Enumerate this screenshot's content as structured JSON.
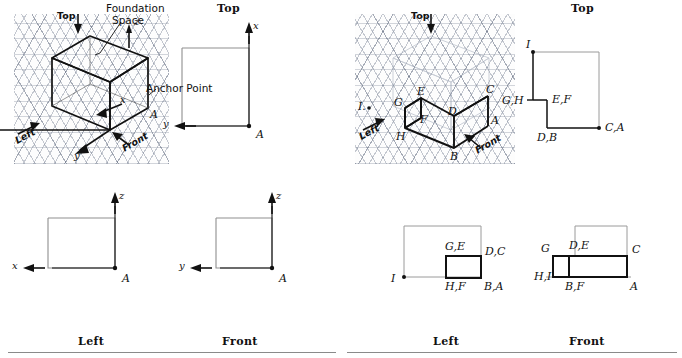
{
  "figure": {
    "title_left_panel": "Foundation space with anchor point",
    "title_right_panel": "Completed object views"
  },
  "panels": [
    {
      "id": "left",
      "views": {
        "top_caption": "Top",
        "left_caption": "Left",
        "front_caption": "Front"
      },
      "iso": {
        "top_arrow_label": "Top",
        "left_arrow_label": "Left",
        "front_arrow_label": "Front",
        "axis_x": "x",
        "axis_y": "y",
        "axis_z": "z",
        "anchor_label": "A",
        "callout_foundation": "Foundation\nSpace",
        "callout_foundation_line1": "Foundation",
        "callout_foundation_line2": "Space",
        "callout_anchor": "Anchor Point"
      },
      "top_view": {
        "axis_x": "x",
        "axis_y": "y",
        "anchor": "A"
      },
      "left_view": {
        "axis_x": "x",
        "axis_z": "z",
        "anchor": "A"
      },
      "front_view": {
        "axis_y": "y",
        "axis_z": "z",
        "anchor": "A"
      }
    },
    {
      "id": "right",
      "views": {
        "top_caption": "Top",
        "left_caption": "Left",
        "front_caption": "Front"
      },
      "iso": {
        "top_arrow_label": "Top",
        "left_arrow_label": "Left",
        "front_arrow_label": "Front",
        "point_i": "I.",
        "vertices": [
          "G",
          "E",
          "D",
          "C",
          "F",
          "A",
          "H",
          "B"
        ]
      },
      "top_view": {
        "labels": [
          "I",
          "G,H",
          "E,F",
          "D,B",
          "C,A"
        ]
      },
      "left_view": {
        "labels": [
          "I",
          "G,E",
          "D,C",
          "H,F",
          "B,A"
        ]
      },
      "front_view": {
        "labels": [
          "G",
          "D,E",
          "C",
          "H,I",
          "B,F",
          "A"
        ]
      }
    }
  ],
  "colors": {
    "ink": "#111111",
    "grid_major": "#6f8bb0",
    "grid_minor": "#9db0c8",
    "rule": "#8a8a8a",
    "construction": "#9a9a9a"
  }
}
